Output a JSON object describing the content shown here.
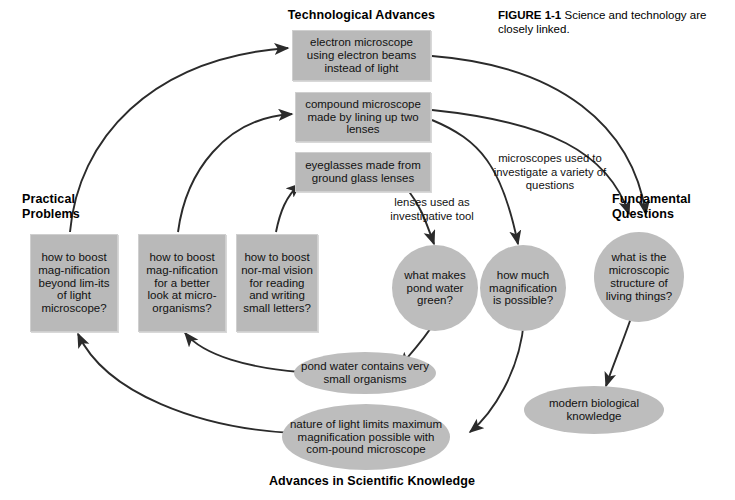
{
  "figure": {
    "caption_label": "FIGURE 1-1",
    "caption_text": "Science and technology are closely linked."
  },
  "headings": {
    "technological_advances": "Technological Advances",
    "practical_problems": "Practical\nProblems",
    "fundamental_questions": "Fundamental\nQuestions",
    "advances_in_scientific_knowledge": "Advances in Scientific Knowledge"
  },
  "technology_boxes": [
    {
      "id": "electron-microscope",
      "text": "electron microscope using electron beams instead of light"
    },
    {
      "id": "compound-microscope",
      "text": "compound microscope made by lining up two lenses"
    },
    {
      "id": "eyeglasses",
      "text": "eyeglasses made from ground glass lenses"
    }
  ],
  "problem_boxes": [
    {
      "id": "boost-magnification-light-limits",
      "text": "how to boost mag-nification beyond lim-its of light microscope?"
    },
    {
      "id": "boost-magnification-microorganisms",
      "text": "how to boost mag-nification for a better look at micro-organisms?"
    },
    {
      "id": "boost-normal-vision",
      "text": "how to boost nor-mal vision for reading and writing small letters?"
    }
  ],
  "question_circles": [
    {
      "id": "pond-water-green",
      "text": "what makes pond water green?"
    },
    {
      "id": "how-much-magnification",
      "text": "how much magnification is possible?"
    },
    {
      "id": "microscopic-structure",
      "text": "what is the microscopic structure of living things?"
    }
  ],
  "knowledge_ellipses": [
    {
      "id": "pond-water-organisms",
      "text": "pond water contains very small organisms"
    },
    {
      "id": "nature-of-light-limits",
      "text": "nature of light limits maximum magnification possible with com-pound microscope"
    },
    {
      "id": "modern-biological-knowledge",
      "text": "modern biological knowledge"
    }
  ],
  "edge_labels": [
    {
      "id": "lenses-investigative-tool",
      "text": "lenses used as investigative tool"
    },
    {
      "id": "microscopes-variety-questions",
      "text": "microscopes used to investigate a variety of questions"
    }
  ],
  "colors": {
    "node_fill": "#bdbdbd",
    "box_fill": "#b9b9b9",
    "stroke": "#2b2b2b",
    "background": "#ffffff",
    "text": "#111111"
  },
  "diagram": {
    "type": "cycle-flow-diagram",
    "title": "Science and technology are closely linked"
  }
}
